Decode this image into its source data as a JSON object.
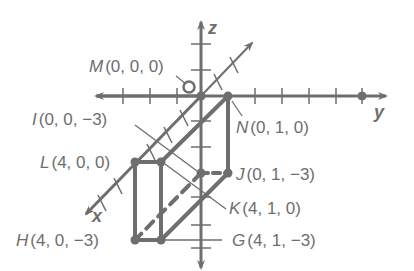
{
  "colors": {
    "stroke": "#6e6e6e",
    "background": "#ffffff"
  },
  "axes": {
    "x_label": "x",
    "y_label": "y",
    "z_label": "z"
  },
  "origin_marker": "O",
  "points": {
    "M": {
      "letter": "M",
      "coords": "(0, 0, 0)"
    },
    "N": {
      "letter": "N",
      "coords": "(0, 1, 0)"
    },
    "I": {
      "letter": "I",
      "coords": "(0, 0, −3)"
    },
    "J": {
      "letter": "J",
      "coords": "(0, 1, −3)"
    },
    "L": {
      "letter": "L",
      "coords": "(4, 0, 0)"
    },
    "K": {
      "letter": "K",
      "coords": "(4, 1, 0)"
    },
    "H": {
      "letter": "H",
      "coords": "(4, 0, −3)"
    },
    "G": {
      "letter": "G",
      "coords": "(4, 1, −3)"
    }
  }
}
